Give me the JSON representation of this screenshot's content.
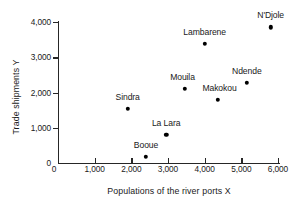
{
  "chart_data": {
    "type": "scatter",
    "title": "",
    "xlabel": "Populations of the river ports X",
    "ylabel": "Trade shipments Y",
    "xlim": [
      0,
      6200
    ],
    "ylim": [
      0,
      4050
    ],
    "grid": false,
    "legend": "none",
    "x_ticks": [
      {
        "value": 0,
        "label": "0"
      },
      {
        "value": 1000,
        "label": "1,000"
      },
      {
        "value": 2000,
        "label": "2,000"
      },
      {
        "value": 3000,
        "label": "3,000"
      },
      {
        "value": 4000,
        "label": "4,000"
      },
      {
        "value": 5000,
        "label": "5,000"
      },
      {
        "value": 6000,
        "label": "6,000"
      }
    ],
    "y_ticks": [
      {
        "value": 0,
        "label": "0"
      },
      {
        "value": 1000,
        "label": "1,000"
      },
      {
        "value": 2000,
        "label": "2,000"
      },
      {
        "value": 3000,
        "label": "3,000"
      },
      {
        "value": 4000,
        "label": "4,000"
      }
    ],
    "points": [
      {
        "label": "Booue",
        "x": 2400,
        "y": 180,
        "label_dx": 0,
        "label_dy": -7
      },
      {
        "label": "Sindra",
        "x": 1900,
        "y": 1530,
        "label_dx": 0,
        "label_dy": -7
      },
      {
        "label": "La Lara",
        "x": 2950,
        "y": 800,
        "label_dx": 0,
        "label_dy": -7
      },
      {
        "label": "Mouila",
        "x": 3450,
        "y": 2100,
        "label_dx": -2,
        "label_dy": -7
      },
      {
        "label": "Makokou",
        "x": 4350,
        "y": 1800,
        "label_dx": 2,
        "label_dy": -7
      },
      {
        "label": "Lambarene",
        "x": 4000,
        "y": 3380,
        "label_dx": 0,
        "label_dy": -7
      },
      {
        "label": "Ndende",
        "x": 5150,
        "y": 2280,
        "label_dx": 0,
        "label_dy": -7
      },
      {
        "label": "N'Djole",
        "x": 5800,
        "y": 3850,
        "label_dx": 0,
        "label_dy": -7
      }
    ],
    "colors": {
      "marker": "#000000",
      "axis": "#262626",
      "text": "#1a1a1a",
      "background": "#ffffff"
    }
  }
}
